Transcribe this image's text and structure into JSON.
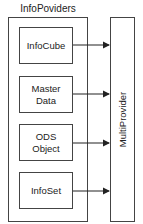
{
  "diagram": {
    "group_title": "InfoPoviders",
    "providers": [
      {
        "label": "InfoCube"
      },
      {
        "label": "Master\nData"
      },
      {
        "label": "ODS\nObject"
      },
      {
        "label": "InfoSet"
      }
    ],
    "target": {
      "label": "MultiProvider"
    },
    "colors": {
      "stroke": "#444444",
      "background": "#ffffff",
      "text": "#222222"
    }
  }
}
